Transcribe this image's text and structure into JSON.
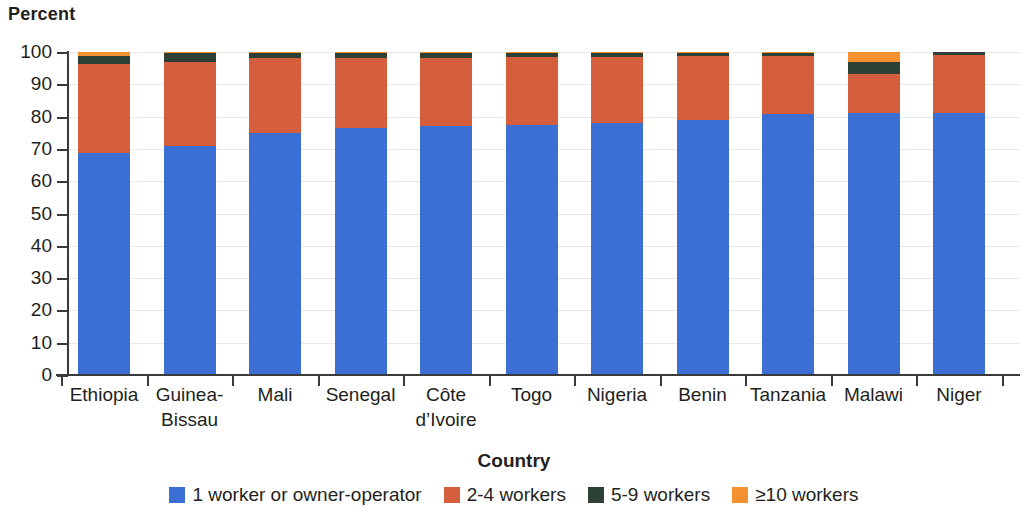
{
  "chart_data": {
    "type": "bar",
    "subtype": "stacked-bar-100",
    "title": "",
    "xlabel": "Country",
    "ylabel": "Percent",
    "ylim": [
      0,
      100
    ],
    "yticks": [
      0,
      10,
      20,
      30,
      40,
      50,
      60,
      70,
      80,
      90,
      100
    ],
    "ytick_labels": [
      "0",
      "10",
      "20",
      "30",
      "40",
      "50",
      "60",
      "70",
      "80",
      "90",
      "100"
    ],
    "grid": true,
    "legend_position": "bottom",
    "categories": [
      "Ethiopia",
      "Guinea-Bissau",
      "Mali",
      "Senegal",
      "Côte d’Ivoire",
      "Togo",
      "Nigeria",
      "Benin",
      "Tanzania",
      "Malawi",
      "Niger"
    ],
    "category_lines": [
      [
        "Ethiopia"
      ],
      [
        "Guinea-",
        "Bissau"
      ],
      [
        "Mali"
      ],
      [
        "Senegal"
      ],
      [
        "Côte",
        "d’Ivoire"
      ],
      [
        "Togo"
      ],
      [
        "Nigeria"
      ],
      [
        "Benin"
      ],
      [
        "Tanzania"
      ],
      [
        "Malawi"
      ],
      [
        "Niger"
      ]
    ],
    "series": [
      {
        "name": "1 worker or owner-operator",
        "color": "#3b6fd4",
        "values": [
          68.7,
          70.9,
          74.9,
          76.5,
          77.2,
          77.3,
          78.1,
          79.1,
          80.8,
          81.0,
          81.2
        ]
      },
      {
        "name": "2-4 workers",
        "color": "#d55e3c",
        "values": [
          27.7,
          26.1,
          23.1,
          21.7,
          21.0,
          21.2,
          20.5,
          19.7,
          18.0,
          12.2,
          18.0
        ]
      },
      {
        "name": "5-9 workers",
        "color": "#2d4035",
        "values": [
          2.5,
          2.7,
          1.6,
          1.5,
          1.6,
          1.3,
          1.2,
          1.0,
          0.9,
          3.8,
          0.8
        ]
      },
      {
        "name": "≥10 workers",
        "color": "#f5902e",
        "values": [
          1.1,
          0.3,
          0.4,
          0.3,
          0.2,
          0.2,
          0.2,
          0.2,
          0.3,
          3.0,
          0.0
        ]
      }
    ]
  },
  "axes": {
    "y_unit_title": "Percent",
    "x_axis_title": "Country"
  },
  "legend": {
    "items": [
      {
        "label": "1 worker or owner-operator",
        "color": "#3b6fd4",
        "swatch_name": "legend-swatch-1-worker"
      },
      {
        "label": "2-4 workers",
        "color": "#d55e3c",
        "swatch_name": "legend-swatch-2-4-workers"
      },
      {
        "label": "5-9 workers",
        "color": "#2d4035",
        "swatch_name": "legend-swatch-5-9-workers"
      },
      {
        "label": "≥10 workers",
        "color": "#f5902e",
        "swatch_name": "legend-swatch-10-plus-workers"
      }
    ]
  }
}
